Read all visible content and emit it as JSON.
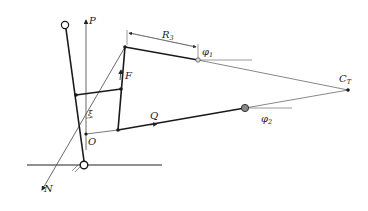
{
  "diagram": {
    "labels": {
      "P": "P",
      "F": "F",
      "R": "R",
      "R_sub": "3",
      "phi1": "φ",
      "phi1_sub": "1",
      "phi2": "φ",
      "phi2_sub": "2",
      "C": "C",
      "C_sub": "T",
      "Q": "Q",
      "O": "O",
      "N": "N",
      "xi": "ξ"
    },
    "colors": {
      "line": "#1a1a1a",
      "thin_line": "#555555",
      "joint_fill": "#888888"
    }
  }
}
